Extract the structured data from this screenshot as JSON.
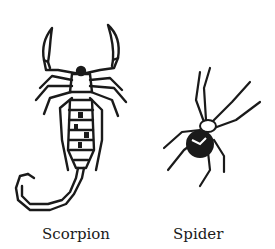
{
  "figures": [
    {
      "name": "scorpion",
      "label": "Scorpion"
    },
    {
      "name": "spider",
      "label": "Spider"
    }
  ],
  "colors": {
    "ink": "#1a1a1a",
    "background": "#ffffff"
  }
}
